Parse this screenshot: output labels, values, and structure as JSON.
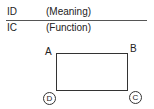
{
  "legend": {
    "row1": {
      "code": "ID",
      "desc": "(Meaning)"
    },
    "row2": {
      "code": "IC",
      "desc": "(Function)"
    }
  },
  "diagram": {
    "corners": {
      "top_left": "A",
      "top_right": "B",
      "bottom_left": "D",
      "bottom_right": "C"
    },
    "circled_corners": [
      "D",
      "C"
    ]
  }
}
